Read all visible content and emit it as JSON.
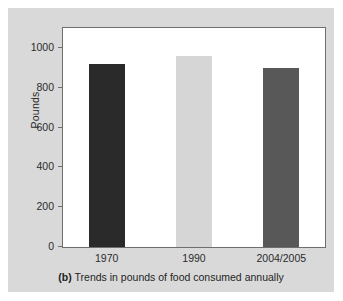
{
  "figure": {
    "caption_tag": "(b)",
    "caption_text": "Trends in pounds of food consumed annually",
    "card_color": "#d9d9d9",
    "plot_background": "#ffffff",
    "frame_color": "#6e6e6e"
  },
  "chart_data": {
    "type": "bar",
    "title": "",
    "categories": [
      "1970",
      "1990",
      "2004/2005"
    ],
    "values": [
      920,
      958,
      898
    ],
    "series": [
      {
        "name": "Pounds of food consumed annually",
        "values": [
          920,
          958,
          898
        ]
      }
    ],
    "bar_colors": [
      "#2a2a2a",
      "#d6d6d6",
      "#585858"
    ],
    "xlabel": "",
    "ylabel": "Pounds",
    "ylim": [
      0,
      1100
    ],
    "yticks": [
      0,
      200,
      400,
      600,
      800,
      1000
    ],
    "ytick_labels": [
      "0",
      "200",
      "400",
      "600",
      "800",
      "1000"
    ],
    "grid": false,
    "legend": false,
    "legend_position": "none"
  }
}
